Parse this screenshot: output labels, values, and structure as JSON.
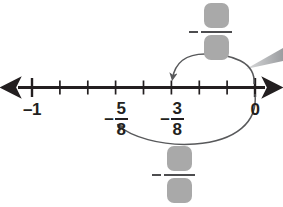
{
  "figure": {
    "background_color": "#ffffff",
    "line_color": "#231f20",
    "curve_color": "#58595b",
    "placeholder_color": "#a9a9a9",
    "pointer_color": "#bcbec0"
  },
  "number_line": {
    "start_label": "-1",
    "end_label": "0",
    "tick_labels": [
      "-1",
      "0"
    ],
    "labels": [
      {
        "id": "minus-one",
        "text": "–1",
        "value": -1,
        "x": 32
      },
      {
        "id": "minus-five-eighths",
        "numerator": "5",
        "denominator": "8",
        "sign": "–",
        "value": -0.625,
        "x": 115
      },
      {
        "id": "minus-three-eighths",
        "numerator": "3",
        "denominator": "8",
        "sign": "–",
        "value": -0.375,
        "x": 171
      },
      {
        "id": "zero",
        "text": "0",
        "value": 0,
        "x": 255
      }
    ],
    "tick_values": [
      -1,
      -0.875,
      -0.75,
      -0.625,
      -0.5,
      -0.375,
      -0.25,
      -0.125,
      0
    ],
    "major_ticks": [
      -1,
      0
    ],
    "minor_ticks": [
      -0.875,
      -0.75,
      -0.625,
      -0.5,
      -0.375,
      -0.25,
      -0.125
    ],
    "left_arrow": true,
    "right_arrow": true
  },
  "jumps": [
    {
      "id": "upper-jump",
      "from_value": 0,
      "to_value": -0.375,
      "from_label": "0",
      "to_label": "-3/8",
      "direction": "left",
      "position": "above"
    },
    {
      "id": "lower-jump",
      "from_value": 0,
      "to_value": -0.625,
      "from_label": "0",
      "to_label": "-5/8",
      "direction": "left",
      "position": "below"
    }
  ],
  "answer_blanks": [
    {
      "id": "top-answer",
      "sign": "−",
      "numerator": "",
      "denominator": "",
      "position": "above-number-line",
      "linked_jump": "upper-jump"
    },
    {
      "id": "bottom-answer",
      "sign": "−",
      "numerator": "",
      "denominator": "",
      "position": "below-number-line",
      "linked_jump": "lower-jump"
    }
  ],
  "pointer": {
    "id": "callout-pointer",
    "description": "tapered gray pointer from right edge toward the top answer blank"
  }
}
